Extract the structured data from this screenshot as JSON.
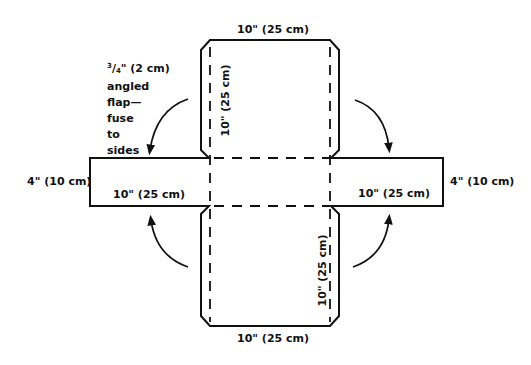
{
  "diagram": {
    "type": "sewing-pattern-flat-layout",
    "stroke_color": "#111111",
    "background": "#ffffff",
    "labels": {
      "top_width": "10\" (25 cm)",
      "bottom_width": "10\" (25 cm)",
      "top_panel_height": "10\" (25 cm)",
      "bottom_panel_height": "10\" (25 cm)",
      "left_flap_width": "10\" (25 cm)",
      "right_flap_width": "10\" (25 cm)",
      "left_flap_height": "4\" (10 cm)",
      "right_flap_height": "4\" (10 cm)"
    },
    "note": {
      "fraction_num": "3",
      "fraction_den": "4",
      "first_line_rest": "\" (2 cm)",
      "lines": [
        "angled",
        "flap—",
        "fuse",
        "to",
        "sides"
      ]
    },
    "arrows": [
      {
        "id": "top-left",
        "direction": "fold-down"
      },
      {
        "id": "top-right",
        "direction": "fold-down"
      },
      {
        "id": "bottom-left",
        "direction": "fold-up"
      },
      {
        "id": "bottom-right",
        "direction": "fold-up"
      }
    ]
  }
}
